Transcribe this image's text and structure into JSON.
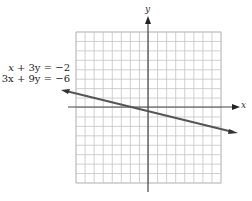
{
  "equations": [
    {
      "lhs_var1": "x",
      "lhs_rest": " + 3y = −2",
      "text": "x + 3y = −2"
    },
    {
      "lhs_var1": "3x",
      "lhs_rest": " + 9y = −6",
      "text": "3x + 9y = −6"
    }
  ],
  "axes": {
    "x_label": "x",
    "y_label": "y"
  },
  "grid": {
    "cols": 16,
    "rows": 16,
    "x_range": [
      -8,
      8
    ],
    "y_range": [
      -8,
      8
    ]
  },
  "chart_data": {
    "type": "line",
    "title": "",
    "xlabel": "x",
    "ylabel": "y",
    "grid": true,
    "xlim": [
      -8,
      8
    ],
    "ylim": [
      -8,
      8
    ],
    "annotations": [
      "x + 3y = −2",
      "3x + 9y = −6"
    ],
    "series": [
      {
        "name": "x + 3y = −2 (coincident with 3x + 9y = −6)",
        "x": [
          -8,
          -2,
          1,
          8
        ],
        "y": [
          2,
          0,
          -1,
          -3.33
        ]
      }
    ]
  }
}
